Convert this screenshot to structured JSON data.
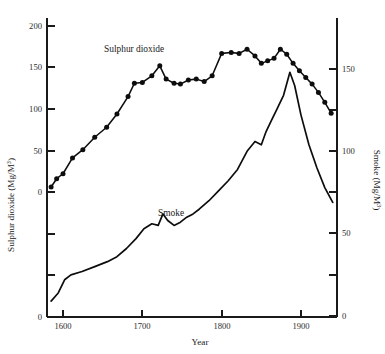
{
  "figure": {
    "background": "#ffffff",
    "ink": "#0d0d0d"
  },
  "labels": {
    "xaxis_title": "Year",
    "yaxis_left_title_main": "Sulphur dioxide (Mg/M",
    "yaxis_left_title_sup": "3",
    "yaxis_left_title_tail": ")",
    "yaxis_right_title_main": "Smoke (Mg/M",
    "yaxis_right_title_sup": "3",
    "yaxis_right_title_tail": ")",
    "series_label_sulphur": "Sulphur dioxide",
    "series_label_smoke": "Smoke"
  },
  "axes": {
    "x_ticklabels": [
      "1600",
      "1700",
      "1800",
      "1900"
    ],
    "x_tickvalues": [
      1600,
      1700,
      1800,
      1900
    ],
    "y_left_ticklabels": [
      "0",
      "50",
      "100",
      "150",
      "200"
    ],
    "y_left_tickvalues": [
      0,
      50,
      100,
      150,
      200
    ],
    "y_left_lower_ticklabel": "0",
    "y_right_ticklabels": [
      "0",
      "50",
      "100",
      "150"
    ],
    "y_right_tickvalues": [
      0,
      50,
      100,
      150
    ]
  },
  "chart_data": {
    "type": "line",
    "title": "",
    "xlabel": "Year",
    "ylabel": "Sulphur dioxide (Mg/M3)",
    "ylabel_right": "Smoke (Mg/M3)",
    "grid": false,
    "legend": "inline-annotations",
    "xlim": [
      1580,
      1946
    ],
    "ylim_left": [
      0,
      200
    ],
    "ylim_right": [
      0,
      160
    ],
    "series": [
      {
        "name": "Sulphur dioxide",
        "axis": "left",
        "units": "Mg/M3",
        "markers": true,
        "marker_shape": "filled-circle",
        "x": [
          1585,
          1592,
          1600,
          1612,
          1625,
          1640,
          1655,
          1668,
          1682,
          1690,
          1700,
          1712,
          1722,
          1730,
          1740,
          1748,
          1758,
          1768,
          1778,
          1788,
          1800,
          1812,
          1822,
          1832,
          1842,
          1850,
          1858,
          1866,
          1874,
          1882,
          1890,
          1898,
          1906,
          1914,
          1922,
          1930,
          1938
        ],
        "y": [
          6,
          16,
          22,
          41,
          51,
          66,
          78,
          94,
          115,
          131,
          132,
          140,
          152,
          136,
          131,
          130,
          135,
          136,
          133,
          140,
          167,
          168,
          167,
          172,
          164,
          155,
          158,
          161,
          172,
          166,
          155,
          146,
          138,
          130,
          120,
          108,
          95
        ]
      },
      {
        "name": "Smoke",
        "axis": "right",
        "units": "Mg/M3",
        "markers": false,
        "x": [
          1585,
          1594,
          1602,
          1610,
          1624,
          1640,
          1656,
          1668,
          1680,
          1692,
          1702,
          1712,
          1720,
          1726,
          1732,
          1740,
          1748,
          1756,
          1764,
          1772,
          1784,
          1796,
          1808,
          1820,
          1832,
          1842,
          1850,
          1856,
          1862,
          1870,
          1878,
          1886,
          1892,
          1900,
          1910,
          1920,
          1930,
          1940
        ],
        "y": [
          9,
          14,
          22,
          25,
          27,
          30,
          33,
          36,
          41,
          47,
          53,
          56,
          55,
          62,
          58,
          55,
          57,
          60,
          62,
          65,
          70,
          76,
          82,
          89,
          100,
          106,
          104,
          112,
          118,
          126,
          134,
          148,
          140,
          122,
          104,
          90,
          78,
          69
        ]
      }
    ]
  },
  "annotations": {
    "sulphur_label_x": 1643,
    "sulphur_label_y_left": 178,
    "smoke_label_x": 1751,
    "smoke_label_y_right": 103
  }
}
